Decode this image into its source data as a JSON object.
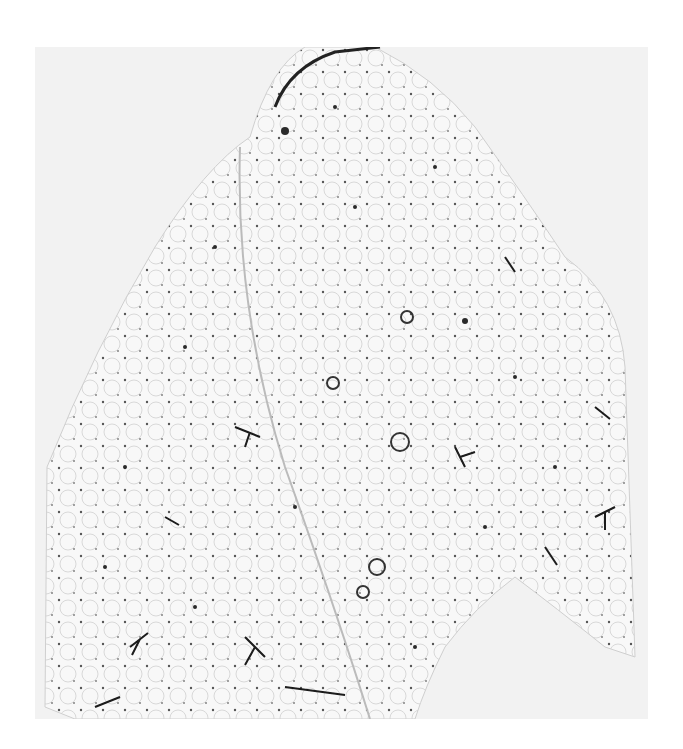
{
  "figure": {
    "kind": "micrograph",
    "panel_background": "#f2f2f2",
    "tissue_color": "#f8f8f8",
    "stain_color": "#1a1a1a",
    "caption_visible": "",
    "caption_note": "caption text cut off at bottom edge; not legible"
  }
}
